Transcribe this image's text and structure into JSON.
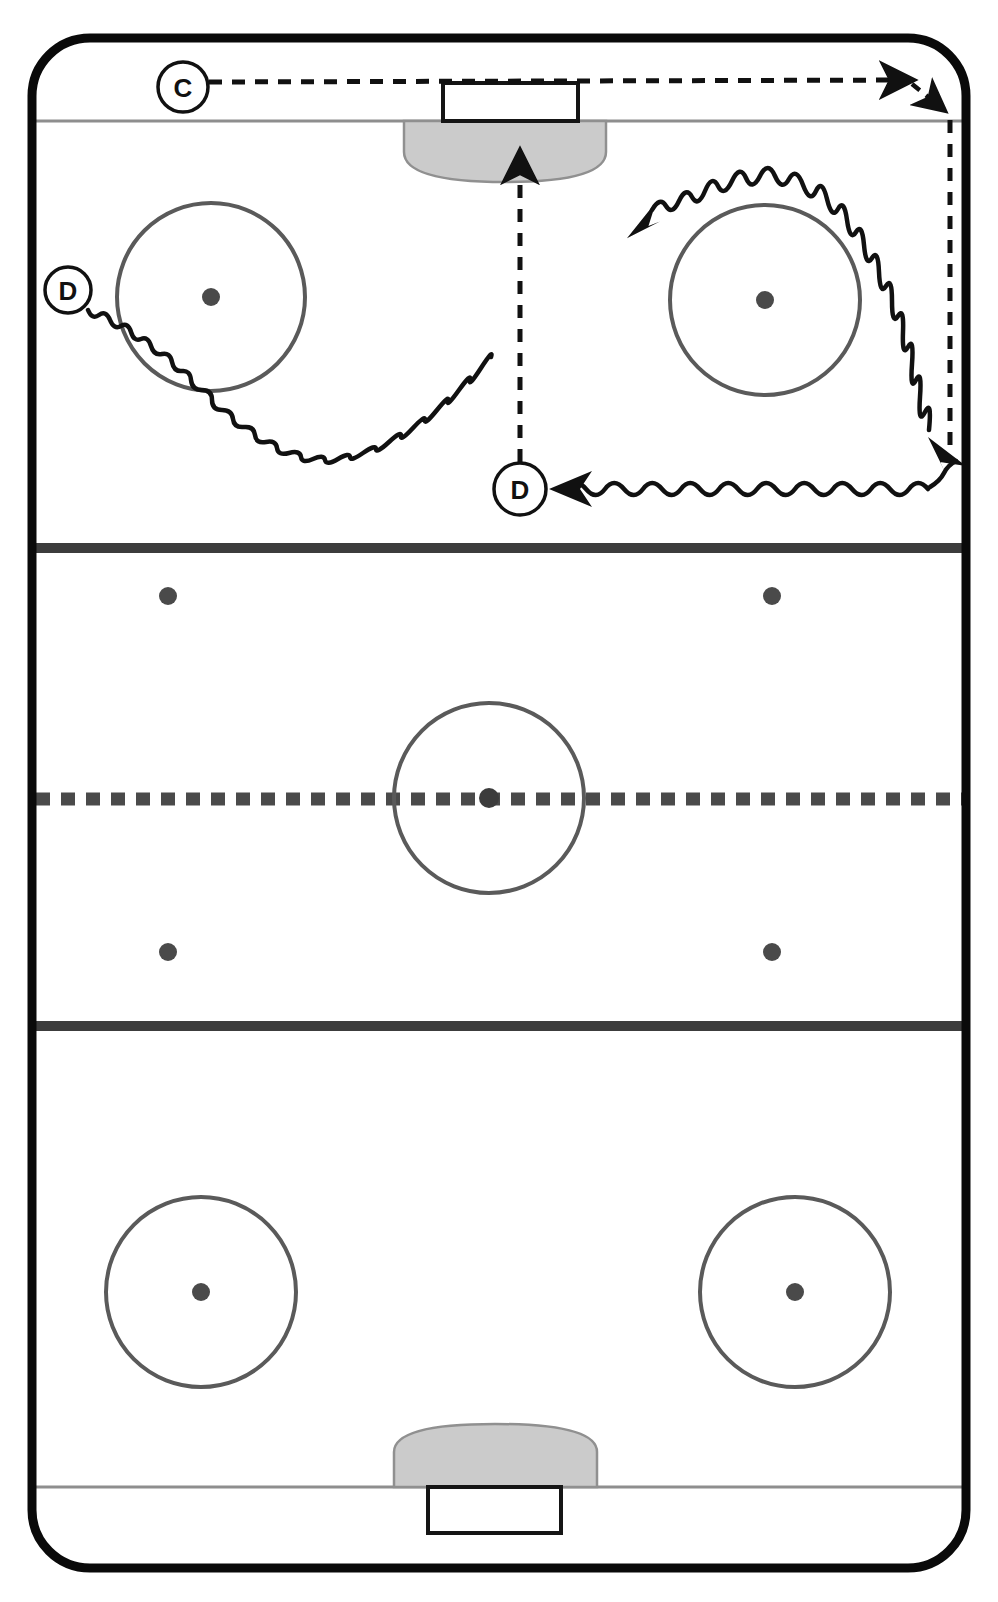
{
  "diagram": {
    "kind": "hockey-rink-drill",
    "sport": "ice-hockey",
    "width": 998,
    "height": 1602,
    "orientation": "vertical"
  },
  "colors": {
    "ice": "#ffffff",
    "boards": "#0a0a0a",
    "line_gray": "#4a4a4a",
    "goal_line": "#8a8a8a",
    "crease_fill": "#cccccc",
    "crease_stroke": "#8a8a8a",
    "faceoff_circle": "#5a5a5a",
    "faceoff_dot": "#4a4a4a",
    "route_stroke": "#111111",
    "label_stroke": "#111111",
    "label_fill": "#ffffff",
    "label_text": "#111111"
  },
  "rink": {
    "boards": {
      "x": 32,
      "y": 38,
      "width": 934,
      "height": 1530,
      "corner_radius": 58,
      "stroke_width": 9,
      "name": "rink-boards"
    },
    "goal_lines": [
      {
        "id": "goal-line-top",
        "y": 121,
        "x1": 36,
        "x2": 962
      },
      {
        "id": "goal-line-bottom",
        "y": 1487,
        "x1": 36,
        "x2": 962
      }
    ],
    "blue_lines": [
      {
        "id": "blue-line-top",
        "y": 548,
        "x1": 32,
        "x2": 966,
        "thickness": 10
      },
      {
        "id": "blue-line-bottom",
        "y": 1026,
        "x1": 32,
        "x2": 966,
        "thickness": 10
      }
    ],
    "center_line": {
      "id": "center-red-line",
      "y": 799,
      "x1": 34,
      "x2": 964,
      "thickness": 12,
      "dash": "14 10"
    },
    "center_circle": {
      "cx": 489,
      "cy": 798,
      "r": 95
    },
    "center_dot": {
      "cx": 489,
      "cy": 798,
      "r": 9
    },
    "faceoff_circles": [
      {
        "id": "faceoff-circle-top-left",
        "cx": 211,
        "cy": 297,
        "r": 94
      },
      {
        "id": "faceoff-circle-top-right",
        "cx": 765,
        "cy": 300,
        "r": 95
      },
      {
        "id": "faceoff-circle-bottom-left",
        "cx": 201,
        "cy": 1292,
        "r": 95
      },
      {
        "id": "faceoff-circle-bottom-right",
        "cx": 795,
        "cy": 1292,
        "r": 95
      }
    ],
    "faceoff_dots": [
      {
        "id": "dot-top-left",
        "cx": 211,
        "cy": 297,
        "r": 8
      },
      {
        "id": "dot-top-right",
        "cx": 765,
        "cy": 300,
        "r": 8
      },
      {
        "id": "dot-bottom-left",
        "cx": 201,
        "cy": 1292,
        "r": 8
      },
      {
        "id": "dot-bottom-right",
        "cx": 795,
        "cy": 1292,
        "r": 8
      },
      {
        "id": "dot-neutral-top-left",
        "cx": 168,
        "cy": 596,
        "r": 8
      },
      {
        "id": "dot-neutral-top-right",
        "cx": 772,
        "cy": 596,
        "r": 8
      },
      {
        "id": "dot-neutral-bottom-left",
        "cx": 168,
        "cy": 952,
        "r": 8
      },
      {
        "id": "dot-neutral-bottom-right",
        "cx": 772,
        "cy": 952,
        "r": 8
      }
    ],
    "creases": [
      {
        "id": "crease-top",
        "x1": 404,
        "x2": 606,
        "goal_line_y": 121,
        "depth": 60,
        "direction": "down"
      },
      {
        "id": "crease-bottom",
        "x1": 394,
        "x2": 597,
        "goal_line_y": 1487,
        "depth": 62,
        "direction": "up"
      }
    ],
    "nets": [
      {
        "id": "net-top",
        "x": 443,
        "y": 83,
        "width": 135,
        "height": 38
      },
      {
        "id": "net-bottom",
        "x": 428,
        "y": 1487,
        "width": 133,
        "height": 46
      }
    ]
  },
  "routes": {
    "pass_c_to_corner": {
      "id": "pass-line-c",
      "label": "C",
      "style": "dashed",
      "meaning": "pass",
      "start": [
        208,
        87
      ],
      "end": [
        918,
        80
      ]
    },
    "pass_corner_deflect": {
      "id": "pass-line-corner-deflect",
      "style": "dashed",
      "meaning": "pass",
      "start": [
        914,
        84
      ],
      "end": [
        950,
        114
      ]
    },
    "dashed_wall_down": {
      "id": "puck-path-right-wall",
      "style": "dashed",
      "meaning": "puck-path",
      "start": [
        950,
        118
      ],
      "end": [
        950,
        452
      ]
    },
    "dashed_d_to_net": {
      "id": "pass-line-d-to-net",
      "style": "dashed",
      "meaning": "pass",
      "start": [
        520,
        463
      ],
      "end": [
        520,
        150
      ]
    },
    "skate_d_around_circles": {
      "id": "skate-route-d-left",
      "style": "squiggle",
      "meaning": "skating-with-puck",
      "from_label": "D",
      "to_arrow": [
        648,
        212
      ]
    },
    "skate_right_circle_to_corner": {
      "id": "skate-route-right-circle",
      "style": "squiggle",
      "meaning": "skating-with-puck",
      "to_arrow": [
        952,
        458
      ]
    },
    "skate_corner_to_d": {
      "id": "skate-route-corner-to-d",
      "style": "squiggle",
      "meaning": "skating-with-puck",
      "start": [
        930,
        487
      ],
      "to_arrow": [
        552,
        489
      ]
    }
  },
  "player_labels": [
    {
      "id": "label-c",
      "text": "C",
      "cx": 183,
      "cy": 87,
      "r": 25,
      "role": "center"
    },
    {
      "id": "label-d-left",
      "text": "D",
      "cx": 68,
      "cy": 290,
      "r": 23,
      "role": "defense"
    },
    {
      "id": "label-d-slot",
      "text": "D",
      "cx": 520,
      "cy": 489,
      "r": 26,
      "role": "defense"
    }
  ]
}
